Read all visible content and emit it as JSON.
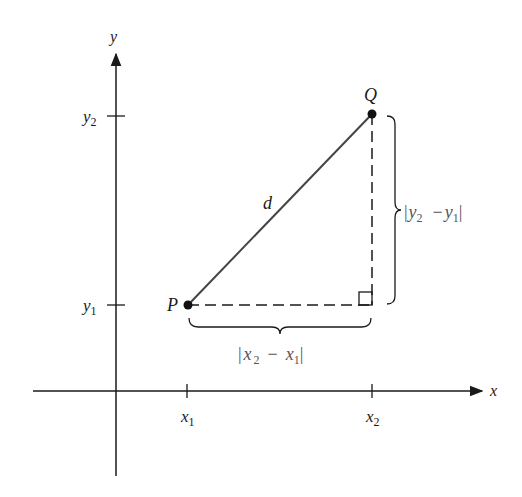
{
  "diagram": {
    "type": "distance-formula-figure",
    "axes": {
      "x_label": "x",
      "y_label": "y"
    },
    "ticks": {
      "x1": {
        "base": "x",
        "sub": "1"
      },
      "x2": {
        "base": "x",
        "sub": "2"
      },
      "y1": {
        "base": "y",
        "sub": "1"
      },
      "y2": {
        "base": "y",
        "sub": "2"
      }
    },
    "points": {
      "P": "P",
      "Q": "Q"
    },
    "hypotenuse_label": "d",
    "horizontal_brace_label": {
      "bar_l": "|",
      "a": "x",
      "a_sub": "2",
      "op": "−",
      "b": "x",
      "b_sub": "1",
      "bar_r": "|"
    },
    "vertical_brace_label": {
      "bar_l": "|",
      "a": "y",
      "a_sub": "2",
      "op": "−",
      "b": "y",
      "b_sub": "1",
      "bar_r": "|"
    },
    "colors": {
      "line": "#1a1a1a",
      "hypotenuse": "#444444",
      "label_gray": "#555555"
    }
  }
}
